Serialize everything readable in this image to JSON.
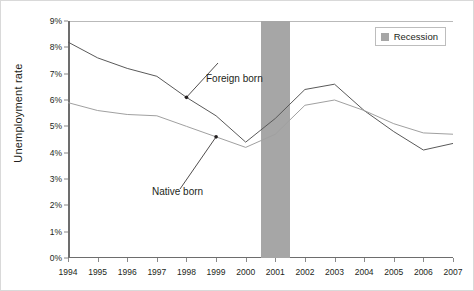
{
  "chart_data": {
    "type": "line",
    "title": "",
    "xlabel": "",
    "ylabel": "Unemployment rate",
    "x": [
      1994,
      1995,
      1996,
      1997,
      1998,
      1999,
      2000,
      2001,
      2002,
      2003,
      2004,
      2005,
      2006,
      2007
    ],
    "xtick_labels": [
      "1994",
      "1995",
      "1996",
      "1997",
      "1998",
      "1999",
      "2000",
      "2001",
      "2002",
      "2003",
      "2004",
      "2005",
      "2006",
      "2007"
    ],
    "xlim": [
      1994,
      2007
    ],
    "ylim": [
      0,
      9
    ],
    "ytick_labels": [
      "0%",
      "1%",
      "2%",
      "3%",
      "4%",
      "5%",
      "6%",
      "7%",
      "8%",
      "9%"
    ],
    "ytick_values": [
      0,
      1,
      2,
      3,
      4,
      5,
      6,
      7,
      8,
      9
    ],
    "grid": false,
    "legend_position": "top-right",
    "series": [
      {
        "name": "Foreign born",
        "color": "#595959",
        "values": [
          8.2,
          7.6,
          7.2,
          6.9,
          6.1,
          5.4,
          4.4,
          5.3,
          6.4,
          6.6,
          5.6,
          4.8,
          4.1,
          4.35
        ]
      },
      {
        "name": "Native born",
        "color": "#a0a0a0",
        "values": [
          5.9,
          5.6,
          5.45,
          5.4,
          5.0,
          4.6,
          4.2,
          4.7,
          5.8,
          6.0,
          5.6,
          5.1,
          4.75,
          4.7
        ]
      }
    ],
    "annotations": [
      {
        "text": "Foreign born",
        "points_to_series": "Foreign born",
        "points_to_x": 1998
      },
      {
        "text": "Native born",
        "points_to_series": "Native born",
        "points_to_x": 1999
      }
    ],
    "shaded_regions": [
      {
        "label": "Recession",
        "x_start": 2000.5,
        "x_end": 2001.5,
        "color": "#a6a6a6"
      }
    ]
  },
  "legend": {
    "items": [
      {
        "label": "Recession",
        "color": "#a6a6a6"
      }
    ]
  }
}
